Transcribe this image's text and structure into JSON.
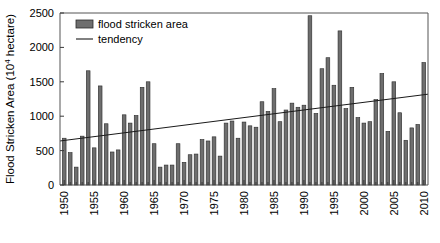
{
  "chart_data": {
    "type": "bar",
    "title": "",
    "subtitle": "",
    "xlabel": "",
    "ylabel": "Flood Stricken Area (10⁴ hectare)",
    "ylabel_parts": {
      "prefix": "Flood Stricken Area (10",
      "exponent": "4",
      "suffix": " hectare)"
    },
    "ylim": [
      0,
      2500
    ],
    "xlim": [
      1949.3,
      2010.7
    ],
    "y_ticks": [
      0,
      500,
      1000,
      1500,
      2000,
      2500
    ],
    "y_tick_labels": [
      "0",
      "500",
      "1000",
      "1500",
      "2000",
      "2500"
    ],
    "x_ticks": [
      1950,
      1955,
      1960,
      1965,
      1970,
      1975,
      1980,
      1985,
      1990,
      1995,
      2000,
      2005,
      2010
    ],
    "x_tick_labels": [
      "1950",
      "1955",
      "1960",
      "1965",
      "1970",
      "1975",
      "1980",
      "1985",
      "1990",
      "1995",
      "2000",
      "2005",
      "2010"
    ],
    "x_minor_ticks_every": 1,
    "grid": false,
    "legend_position": "top-left",
    "legend": [
      {
        "name": "flood stricken area",
        "marker": "bar",
        "color": "#6e6e6e"
      },
      {
        "name": "tendency",
        "marker": "line",
        "color": "#1a1a1a"
      }
    ],
    "categories": [
      "1950",
      "1951",
      "1952",
      "1953",
      "1954",
      "1955",
      "1956",
      "1957",
      "1958",
      "1959",
      "1960",
      "1961",
      "1962",
      "1963",
      "1964",
      "1965",
      "1966",
      "1967",
      "1968",
      "1969",
      "1970",
      "1971",
      "1972",
      "1973",
      "1974",
      "1975",
      "1976",
      "1977",
      "1978",
      "1979",
      "1980",
      "1981",
      "1982",
      "1983",
      "1984",
      "1985",
      "1986",
      "1987",
      "1988",
      "1989",
      "1990",
      "1991",
      "1992",
      "1993",
      "1994",
      "1995",
      "1996",
      "1997",
      "1998",
      "1999",
      "2000",
      "2001",
      "2002",
      "2003",
      "2004",
      "2005",
      "2006",
      "2007",
      "2008",
      "2009",
      "2010"
    ],
    "series": [
      {
        "name": "flood stricken area",
        "color": "#6e6e6e",
        "values": [
          680,
          470,
          260,
          710,
          1660,
          540,
          1440,
          890,
          480,
          510,
          1020,
          900,
          1010,
          1420,
          1500,
          600,
          260,
          290,
          290,
          600,
          330,
          440,
          450,
          660,
          640,
          700,
          420,
          900,
          930,
          680,
          915,
          860,
          840,
          1210,
          1070,
          1400,
          920,
          1090,
          1190,
          1130,
          1160,
          2460,
          1040,
          1690,
          1850,
          1450,
          2240,
          1110,
          1420,
          980,
          900,
          920,
          1240,
          1620,
          780,
          1500,
          1050,
          650,
          830,
          880,
          1780
        ]
      }
    ],
    "trend": {
      "name": "tendency",
      "color": "#1a1a1a",
      "x_start": 1949.3,
      "x_end": 2010.7,
      "y_start": 640,
      "y_end": 1320
    }
  }
}
